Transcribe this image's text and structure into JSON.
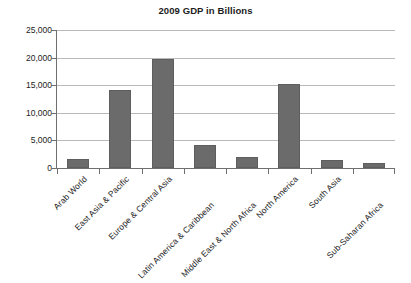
{
  "chart_data": {
    "type": "bar",
    "title": "2009 GDP in Billions",
    "xlabel": "",
    "ylabel": "",
    "ylim": [
      0,
      25000
    ],
    "ytick_labels": [
      "25,000",
      "20,000",
      "15,000",
      "10,000",
      "5,000",
      "0"
    ],
    "ytick_values": [
      25000,
      20000,
      15000,
      10000,
      5000,
      0
    ],
    "grid": true,
    "legend": false,
    "categories": [
      "Arab World",
      "East Asia & Pacific",
      "Europe & Central Asia",
      "Latin America & Caribbean",
      "Middle East & North Africa",
      "North America",
      "South Asia",
      "Sub-Saharan Africa"
    ],
    "values": [
      1650,
      14100,
      19700,
      4150,
      2000,
      15300,
      1450,
      900
    ],
    "bar_color": "#6b6b6b",
    "axis_color": "#6f6f6f",
    "grid_color": "#b9b9b9",
    "background_color": "#ffffff"
  }
}
